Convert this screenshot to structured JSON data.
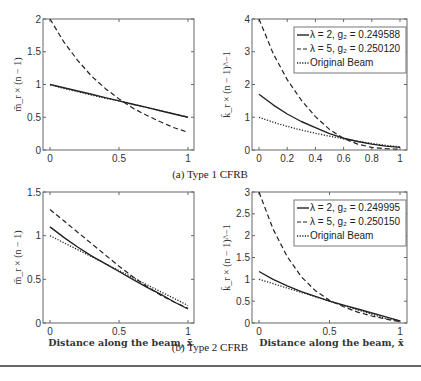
{
  "captions": {
    "a": "(a) Type 1 CFRB",
    "b": "(b) Type 2 CFRB"
  },
  "chart_data": [
    {
      "id": "type1-moment",
      "type": "line",
      "panel": "top-left",
      "ylabel": "m̄_r × (n − 1)",
      "xlabel": "",
      "xlim": [
        0,
        1
      ],
      "ylim": [
        0,
        2
      ],
      "xticks": [
        "0",
        "0.5",
        "1"
      ],
      "yticks": [
        "0",
        "0.5",
        "1",
        "1.5",
        "2"
      ],
      "grid": false,
      "x": [
        0,
        0.1,
        0.2,
        0.3,
        0.4,
        0.5,
        0.6,
        0.7,
        0.8,
        0.9,
        1.0
      ],
      "series": [
        {
          "name": "λ = 2, g2 = 0.249588",
          "style": "solid",
          "values": [
            1.0,
            0.95,
            0.9,
            0.85,
            0.8,
            0.75,
            0.7,
            0.65,
            0.6,
            0.55,
            0.5
          ]
        },
        {
          "name": "λ = 5, g2 = 0.250120",
          "style": "dashed",
          "values": [
            2.0,
            1.65,
            1.37,
            1.13,
            0.94,
            0.78,
            0.64,
            0.53,
            0.43,
            0.34,
            0.27
          ]
        },
        {
          "name": "Original Beam",
          "style": "dotted",
          "values": [
            1.0,
            0.94,
            0.89,
            0.84,
            0.79,
            0.75,
            0.7,
            0.65,
            0.6,
            0.55,
            0.5
          ]
        }
      ]
    },
    {
      "id": "type1-stiffness",
      "type": "line",
      "panel": "top-right",
      "ylabel": "k̄_r × (n − 1)^−1",
      "xlabel": "",
      "xlim": [
        0,
        1
      ],
      "ylim": [
        0,
        4
      ],
      "xticks": [
        "0",
        "0.2",
        "0.4",
        "0.6",
        "0.8",
        "1"
      ],
      "yticks": [
        "0",
        "1",
        "2",
        "3",
        "4"
      ],
      "grid": false,
      "legend": {
        "position": "upper right",
        "entries": [
          "λ = 2, g₂ = 0.249588",
          "λ = 5, g₂ = 0.250120",
          "Original Beam"
        ]
      },
      "x": [
        0,
        0.1,
        0.2,
        0.3,
        0.4,
        0.5,
        0.6,
        0.7,
        0.8,
        0.9,
        1.0
      ],
      "series": [
        {
          "name": "λ = 2, g2 = 0.249588",
          "style": "solid",
          "values": [
            1.7,
            1.38,
            1.1,
            0.87,
            0.68,
            0.5,
            0.36,
            0.26,
            0.18,
            0.12,
            0.08
          ]
        },
        {
          "name": "λ = 5, g2 = 0.250120",
          "style": "dashed",
          "values": [
            4.0,
            2.95,
            2.15,
            1.52,
            1.02,
            0.63,
            0.35,
            0.18,
            0.08,
            0.04,
            0.02
          ]
        },
        {
          "name": "Original Beam",
          "style": "dotted",
          "values": [
            1.0,
            0.85,
            0.72,
            0.61,
            0.51,
            0.42,
            0.34,
            0.27,
            0.2,
            0.14,
            0.1
          ]
        }
      ]
    },
    {
      "id": "type2-moment",
      "type": "line",
      "panel": "bottom-left",
      "ylabel": "m̄_r × (n − 1)",
      "xlabel": "Distance along the beam, x̄",
      "xlim": [
        0,
        1
      ],
      "ylim": [
        0,
        1.5
      ],
      "xticks": [
        "0",
        "0.5",
        "1"
      ],
      "yticks": [
        "0",
        "0.5",
        "1",
        "1.5"
      ],
      "grid": false,
      "x": [
        0,
        0.1,
        0.2,
        0.3,
        0.4,
        0.5,
        0.6,
        0.7,
        0.8,
        0.9,
        1.0
      ],
      "series": [
        {
          "name": "λ = 2, g2 = 0.249995",
          "style": "solid",
          "values": [
            1.1,
            0.98,
            0.87,
            0.77,
            0.68,
            0.59,
            0.5,
            0.41,
            0.33,
            0.24,
            0.16
          ]
        },
        {
          "name": "λ = 5, g2 = 0.250150",
          "style": "dashed",
          "values": [
            1.3,
            1.17,
            1.04,
            0.91,
            0.78,
            0.65,
            0.53,
            0.42,
            0.32,
            0.24,
            0.17
          ]
        },
        {
          "name": "Original Beam",
          "style": "dotted",
          "values": [
            1.0,
            0.92,
            0.84,
            0.76,
            0.68,
            0.6,
            0.52,
            0.44,
            0.36,
            0.28,
            0.2
          ]
        }
      ]
    },
    {
      "id": "type2-stiffness",
      "type": "line",
      "panel": "bottom-right",
      "ylabel": "k̄_r × (n − 1)^−1",
      "xlabel": "Distance along the beam, x̄",
      "xlim": [
        0,
        1
      ],
      "ylim": [
        0,
        3
      ],
      "xticks": [
        "0",
        "0.5",
        "1"
      ],
      "yticks": [
        "0",
        "0.5",
        "1",
        "1.5",
        "2",
        "2.5",
        "3"
      ],
      "grid": false,
      "legend": {
        "position": "upper right",
        "entries": [
          "λ = 2, g₂ = 0.249995",
          "λ = 5, g₂ = 0.250150",
          "Original Beam"
        ]
      },
      "x": [
        0,
        0.1,
        0.2,
        0.3,
        0.4,
        0.5,
        0.6,
        0.7,
        0.8,
        0.9,
        1.0
      ],
      "series": [
        {
          "name": "λ = 2, g2 = 0.249995",
          "style": "solid",
          "values": [
            1.18,
            1.0,
            0.85,
            0.72,
            0.61,
            0.5,
            0.41,
            0.32,
            0.23,
            0.14,
            0.05
          ]
        },
        {
          "name": "λ = 5, g2 = 0.250150",
          "style": "dashed",
          "values": [
            3.0,
            2.15,
            1.52,
            1.06,
            0.74,
            0.52,
            0.37,
            0.25,
            0.16,
            0.09,
            0.03
          ]
        },
        {
          "name": "Original Beam",
          "style": "dotted",
          "values": [
            1.0,
            0.9,
            0.8,
            0.7,
            0.6,
            0.5,
            0.4,
            0.3,
            0.2,
            0.1,
            0.05
          ]
        }
      ]
    }
  ]
}
